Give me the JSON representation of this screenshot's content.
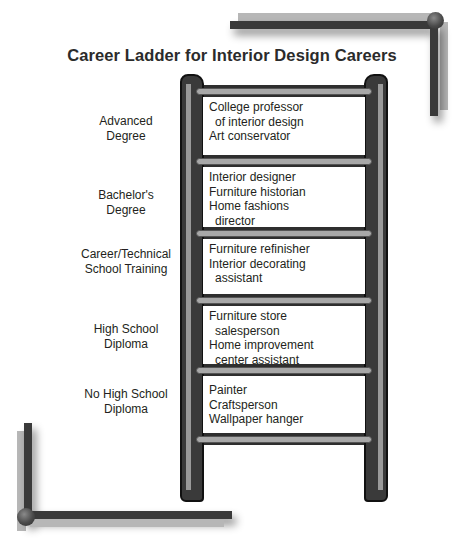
{
  "title": "Career Ladder for Interior Design Careers",
  "colors": {
    "rail": "#3a3a3a",
    "rung": "#a8a8a8",
    "box": "#ffffff",
    "text": "#231f20",
    "bracket_dark": "#3a3a3a",
    "bracket_light": "#b7b7b7"
  },
  "levels": [
    {
      "label_lines": [
        "Advanced",
        "Degree"
      ],
      "careers": [
        "College professor",
        "of interior design",
        "Art conservator"
      ]
    },
    {
      "label_lines": [
        "Bachelor's",
        "Degree"
      ],
      "careers": [
        "Interior designer",
        "Furniture historian",
        "Home fashions",
        "director"
      ]
    },
    {
      "label_lines": [
        "Career/Technical",
        "School Training"
      ],
      "careers": [
        "Furniture refinisher",
        "Interior decorating",
        "assistant"
      ]
    },
    {
      "label_lines": [
        "High School",
        "Diploma"
      ],
      "careers": [
        "Furniture store",
        "salesperson",
        "Home improvement",
        "center assistant"
      ]
    },
    {
      "label_lines": [
        "No High School",
        "Diploma"
      ],
      "careers": [
        "Painter",
        "Craftsperson",
        "Wallpaper hanger"
      ]
    }
  ]
}
